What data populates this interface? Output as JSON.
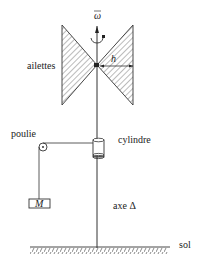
{
  "diagram": {
    "labels": {
      "omega": "ω",
      "ailettes": "ailettes",
      "h": "h",
      "poulie": "poulie",
      "cylindre": "cylindre",
      "mass": "M",
      "axe": "axe Δ",
      "sol": "sol"
    },
    "colors": {
      "line": "#333333",
      "hatch": "#555555",
      "background": "#ffffff"
    }
  }
}
